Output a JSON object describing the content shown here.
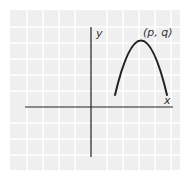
{
  "diagram": {
    "type": "coordinate-plane-parabola",
    "axes": {
      "x_label": "x",
      "y_label": "y"
    },
    "vertex_label": "(p, q)",
    "curve": {
      "shape": "downward-opening parabola",
      "description": "Arc in the first quadrant with maximum point (p, q), both endpoints above the x-axis",
      "color": "#222222"
    },
    "grid": {
      "background": "#efefef",
      "line_color": "#ffffff"
    },
    "axis_color": "#222222"
  }
}
